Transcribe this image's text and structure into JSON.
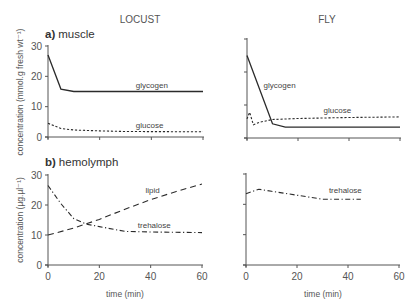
{
  "figure": {
    "column_titles": [
      "LOCUST",
      "FLY"
    ],
    "panel_a": {
      "letter": "a)",
      "name": "muscle",
      "ylabel": "concentration (mmol.g fresh wt⁻¹)"
    },
    "panel_b": {
      "letter": "b)",
      "name": "hemolymph",
      "ylabel": "concentration (µg.µl⁻¹)"
    },
    "xlabel": "time (min)"
  },
  "chart_data": [
    {
      "type": "line",
      "title": "a) muscle - LOCUST",
      "xlabel": "",
      "ylabel": "concentration (mmol.g fresh wt-1)",
      "xlim": [
        0,
        60
      ],
      "ylim": [
        0,
        30
      ],
      "yticks": [
        0,
        10,
        20,
        30
      ],
      "xticks": [
        0,
        20,
        40,
        60
      ],
      "xtick_labels_shown": false,
      "series": [
        {
          "name": "glycogen",
          "style": "solid",
          "x": [
            0,
            5,
            10,
            60
          ],
          "y": [
            27,
            15.8,
            15,
            15
          ]
        },
        {
          "name": "glucose",
          "style": "dotted",
          "x": [
            0,
            5,
            10,
            20,
            30,
            60
          ],
          "y": [
            4.5,
            2.8,
            2.3,
            2,
            1.8,
            1.7
          ]
        }
      ]
    },
    {
      "type": "line",
      "title": "a) muscle - FLY",
      "xlabel": "",
      "ylabel": "",
      "xlim": [
        0,
        60
      ],
      "ylim": [
        0,
        30
      ],
      "yticks": [
        0,
        10,
        20,
        30
      ],
      "xticks": [
        0,
        20,
        40,
        60
      ],
      "ytick_labels_shown": false,
      "xtick_labels_shown": false,
      "series": [
        {
          "name": "glycogen",
          "style": "solid",
          "x": [
            0,
            10,
            15,
            60
          ],
          "y": [
            25,
            4.3,
            3.3,
            3.3
          ]
        },
        {
          "name": "glucose",
          "style": "dotted",
          "x": [
            0,
            1,
            2.5,
            5,
            10,
            20,
            40,
            60
          ],
          "y": [
            5.8,
            7.8,
            4,
            4.8,
            5.6,
            5.9,
            6.2,
            6.4
          ]
        }
      ]
    },
    {
      "type": "line",
      "title": "b) hemolymph - LOCUST",
      "xlabel": "time (min)",
      "ylabel": "concentration (µg.µl-1)",
      "xlim": [
        0,
        60
      ],
      "ylim": [
        0,
        30
      ],
      "yticks": [
        0,
        10,
        20,
        30
      ],
      "xticks": [
        0,
        20,
        40,
        60
      ],
      "series": [
        {
          "name": "lipid",
          "style": "dashed",
          "x": [
            0,
            10,
            20,
            30,
            40,
            50,
            60
          ],
          "y": [
            10,
            12.3,
            15.2,
            18.6,
            21.8,
            24.5,
            27
          ]
        },
        {
          "name": "trehalose",
          "style": "dash-dot",
          "x": [
            0,
            5,
            10,
            15,
            20,
            30,
            40,
            60
          ],
          "y": [
            26.5,
            20.5,
            15.5,
            13.6,
            12.8,
            11.2,
            11,
            10.8
          ]
        }
      ]
    },
    {
      "type": "line",
      "title": "b) hemolymph - FLY",
      "xlabel": "time (min)",
      "ylabel": "",
      "xlim": [
        0,
        60
      ],
      "ylim": [
        0,
        30
      ],
      "yticks": [
        0,
        10,
        20,
        30
      ],
      "xticks": [
        0,
        20,
        40,
        60
      ],
      "ytick_labels_shown": false,
      "series": [
        {
          "name": "trehalose",
          "style": "dash-dot",
          "x": [
            0,
            5,
            10,
            20,
            30,
            45
          ],
          "y": [
            23.5,
            25,
            24.3,
            23,
            21.7,
            21.7
          ]
        }
      ]
    }
  ],
  "labels": {
    "locust_a_glycogen": {
      "text": "glycogen",
      "t": 34,
      "v": 16.2
    },
    "locust_a_glucose": {
      "text": "glucose",
      "t": 34,
      "v": 3.0
    },
    "fly_a_glycogen": {
      "text": "glycogen",
      "t": 6.5,
      "v": 15.3
    },
    "fly_a_glucose": {
      "text": "glucose",
      "t": 30,
      "v": 7.6
    },
    "locust_b_lipid": {
      "text": "lipid",
      "t": 38,
      "v": 24
    },
    "locust_b_trehalose": {
      "text": "trehalose",
      "t": 35,
      "v": 12.5
    },
    "fly_b_trehalose": {
      "text": "trehalose",
      "t": 32.5,
      "v": 23.8
    }
  }
}
